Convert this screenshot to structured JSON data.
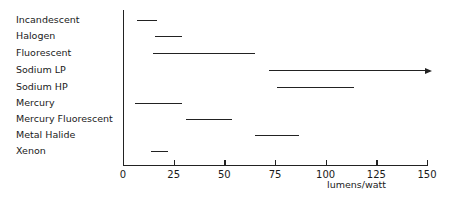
{
  "chart_data": {
    "type": "bar",
    "subtype": "horizontal-range",
    "title": "",
    "xlabel": "lumens/watt",
    "ylabel": "",
    "xlim": [
      0,
      150
    ],
    "xticks": [
      "0",
      "25",
      "50",
      "75",
      "100",
      "125",
      "150"
    ],
    "grid": false,
    "legend": null,
    "categories": [
      "Incandescent",
      "Halogen",
      "Fluorescent",
      "Sodium LP",
      "Sodium HP",
      "Mercury",
      "Mercury Fluorescent",
      "Metal Halide",
      "Xenon"
    ],
    "ranges": [
      {
        "label": "Incandescent",
        "min": 7,
        "max": 17
      },
      {
        "label": "Halogen",
        "min": 16,
        "max": 29
      },
      {
        "label": "Fluorescent",
        "min": 15,
        "max": 65
      },
      {
        "label": "Sodium LP",
        "min": 72,
        "max": 150,
        "open_ended": true
      },
      {
        "label": "Sodium HP",
        "min": 76,
        "max": 114
      },
      {
        "label": "Mercury",
        "min": 6,
        "max": 29
      },
      {
        "label": "Mercury Fluorescent",
        "min": 31,
        "max": 54
      },
      {
        "label": "Metal Halide",
        "min": 65,
        "max": 87
      },
      {
        "label": "Xenon",
        "min": 14,
        "max": 22
      }
    ]
  }
}
